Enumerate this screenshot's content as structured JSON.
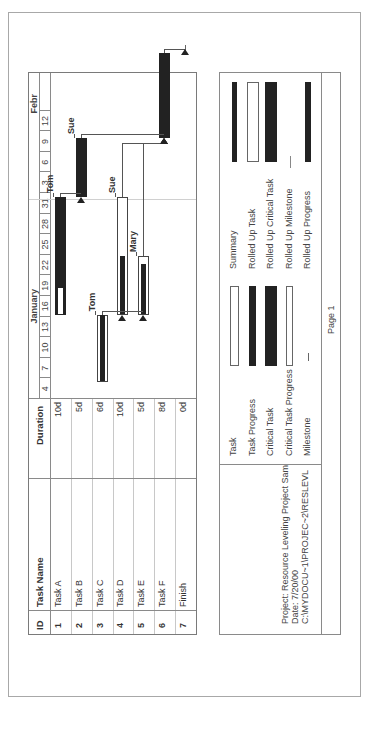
{
  "table": {
    "headers": {
      "id": "ID",
      "name": "Task Name",
      "duration": "Duration"
    },
    "rows": [
      {
        "id": "1",
        "name": "Task A",
        "duration": "10d"
      },
      {
        "id": "2",
        "name": "Task B",
        "duration": "5d"
      },
      {
        "id": "3",
        "name": "Task C",
        "duration": "6d"
      },
      {
        "id": "4",
        "name": "Task D",
        "duration": "10d"
      },
      {
        "id": "5",
        "name": "Task E",
        "duration": "5d"
      },
      {
        "id": "6",
        "name": "Task F",
        "duration": "8d"
      },
      {
        "id": "7",
        "name": "Finish",
        "duration": "0d"
      }
    ]
  },
  "timeline": {
    "months": [
      {
        "label": "January",
        "center_day": 13.5
      },
      {
        "label": "Febr",
        "start_day": 29
      }
    ],
    "ticks": [
      "4",
      "7",
      "10",
      "13",
      "16",
      "19",
      "22",
      "25",
      "28",
      "31",
      "3",
      "6",
      "9",
      "12"
    ],
    "total_days": 47
  },
  "gantt": {
    "tasks": [
      {
        "row": 0,
        "type": "critical",
        "start": 12.2,
        "finish": 29.4,
        "unfilled_to": 16.0,
        "resource": "Tom"
      },
      {
        "row": 1,
        "type": "critical",
        "start": 29.4,
        "finish": 38.0,
        "resource": "Sue"
      },
      {
        "row": 2,
        "type": "progress",
        "start": 2.5,
        "finish": 12.2,
        "progress_to": 12.2,
        "resource": "Tom"
      },
      {
        "row": 3,
        "type": "progress",
        "start": 12.2,
        "finish": 29.4,
        "progress_to": 20.8,
        "resource": "Sue"
      },
      {
        "row": 4,
        "type": "progress",
        "start": 12.2,
        "finish": 20.8,
        "progress_to": 19.6,
        "resource": "Mary"
      },
      {
        "row": 5,
        "type": "critical",
        "start": 38.0,
        "finish": 50.4,
        "resource": ""
      },
      {
        "row": 6,
        "type": "milestone",
        "start": 51.0,
        "finish": 51.0,
        "resource": ""
      }
    ]
  },
  "legend": {
    "col1": [
      "Task",
      "Task Progress",
      "Critical Task",
      "Critical Task Progress",
      "Milestone"
    ],
    "col2": [
      "Summary",
      "Rolled Up Task",
      "Rolled Up Critical Task",
      "Rolled Up Milestone",
      "Rolled Up Progress"
    ]
  },
  "project_info": {
    "project": "Project: Resource Leveling Project Sam",
    "date": "Date: 7/20/00",
    "path": "C:\\MYDOCU~1\\PROJEC~2\\RESLEVL"
  },
  "footer": {
    "page": "Page 1"
  },
  "colors": {
    "bar_dark": "#222222",
    "grid": "#c8c8c8",
    "frame": "#a8a8a8"
  }
}
